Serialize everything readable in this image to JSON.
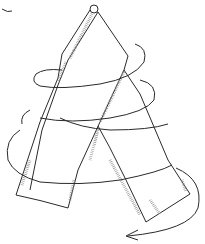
{
  "illustration": {
    "subject": "tape-measure-spiral-drawing",
    "style": "pencil line drawing",
    "colors": {
      "background": "#ffffff",
      "stroke": "#2a2a2a",
      "tick": "#8a8a8a"
    }
  }
}
